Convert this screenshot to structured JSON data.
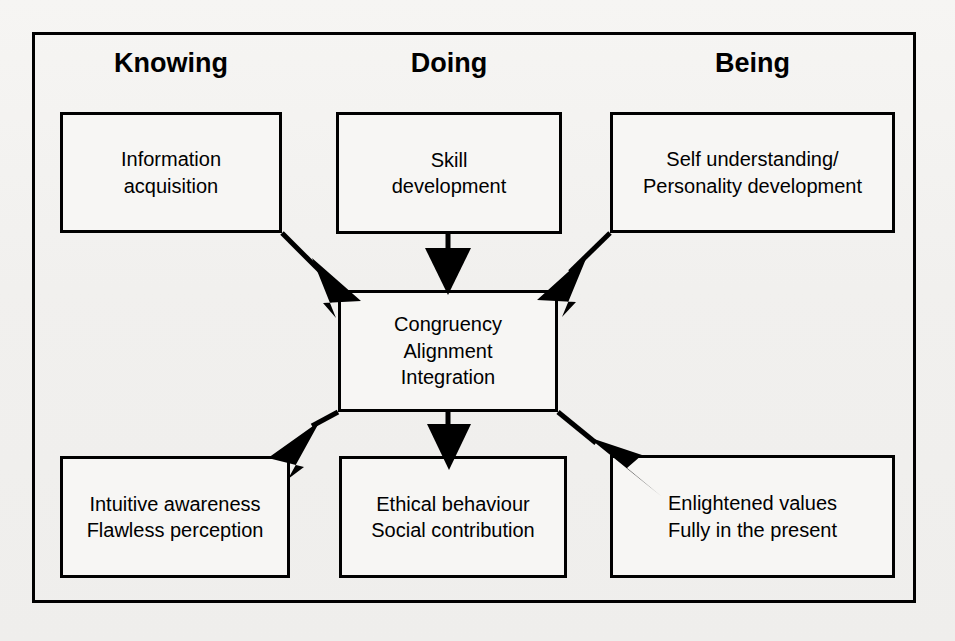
{
  "diagram": {
    "frame": {
      "border_color": "#000000"
    },
    "background_color": "#f1f0ee",
    "columns": [
      {
        "id": "knowing",
        "heading": "Knowing"
      },
      {
        "id": "doing",
        "heading": "Doing"
      },
      {
        "id": "being",
        "heading": "Being"
      }
    ],
    "top_nodes": [
      {
        "id": "information-acquisition",
        "text": "Information\nacquisition"
      },
      {
        "id": "skill-development",
        "text": "Skill\ndevelopment"
      },
      {
        "id": "self-understanding",
        "text": "Self understanding/\nPersonality development"
      }
    ],
    "center_node": {
      "id": "congruency",
      "text": "Congruency\nAlignment\nIntegration"
    },
    "bottom_nodes": [
      {
        "id": "intuitive-awareness",
        "text": "Intuitive awareness\nFlawless perception"
      },
      {
        "id": "ethical-behaviour",
        "text": "Ethical behaviour\nSocial contribution"
      },
      {
        "id": "enlightened-values",
        "text": "Enlightened values\nFully in the present"
      }
    ],
    "connectors": [
      {
        "id": "knowing-to-center",
        "from": "information-acquisition",
        "to": "congruency",
        "style": "solid-arrow"
      },
      {
        "id": "doing-to-center",
        "from": "skill-development",
        "to": "congruency",
        "style": "solid-arrow"
      },
      {
        "id": "being-to-center",
        "from": "self-understanding",
        "to": "congruency",
        "style": "solid-arrow"
      },
      {
        "id": "center-to-intuitive",
        "from": "congruency",
        "to": "intuitive-awareness",
        "style": "solid-arrow"
      },
      {
        "id": "center-to-ethical",
        "from": "congruency",
        "to": "ethical-behaviour",
        "style": "solid-arrow"
      },
      {
        "id": "center-to-enlightened",
        "from": "congruency",
        "to": "enlightened-values",
        "style": "solid-arrow"
      }
    ]
  }
}
